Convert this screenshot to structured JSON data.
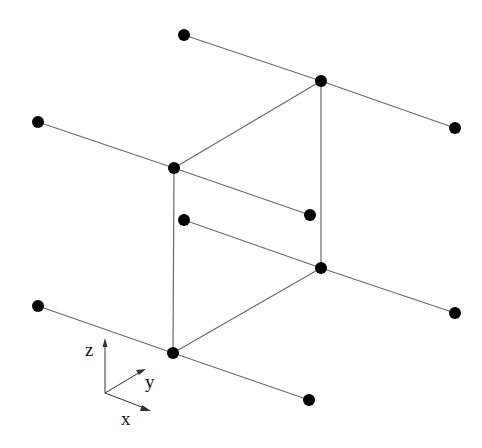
{
  "diagram": {
    "title": "",
    "nodes": [
      {
        "id": "n1",
        "x": 184,
        "y": 35
      },
      {
        "id": "n2",
        "x": 321,
        "y": 81
      },
      {
        "id": "n3",
        "x": 455,
        "y": 128
      },
      {
        "id": "n4",
        "x": 38,
        "y": 122
      },
      {
        "id": "n5",
        "x": 174,
        "y": 168
      },
      {
        "id": "n6",
        "x": 310,
        "y": 215
      },
      {
        "id": "n7",
        "x": 184,
        "y": 220
      },
      {
        "id": "n8",
        "x": 321,
        "y": 268
      },
      {
        "id": "n9",
        "x": 455,
        "y": 313
      },
      {
        "id": "n10",
        "x": 38,
        "y": 306
      },
      {
        "id": "n11",
        "x": 173,
        "y": 353
      },
      {
        "id": "n12",
        "x": 309,
        "y": 400
      }
    ],
    "edges": [
      [
        "n1",
        "n2"
      ],
      [
        "n2",
        "n3"
      ],
      [
        "n4",
        "n5"
      ],
      [
        "n5",
        "n6"
      ],
      [
        "n7",
        "n8"
      ],
      [
        "n8",
        "n9"
      ],
      [
        "n10",
        "n11"
      ],
      [
        "n11",
        "n12"
      ],
      [
        "n5",
        "n2"
      ],
      [
        "n5",
        "n11"
      ],
      [
        "n2",
        "n8"
      ],
      [
        "n11",
        "n8"
      ]
    ],
    "axes": {
      "origin": {
        "x": 105,
        "y": 393
      },
      "labels": {
        "z": "z",
        "y": "y",
        "x": "x"
      }
    }
  }
}
